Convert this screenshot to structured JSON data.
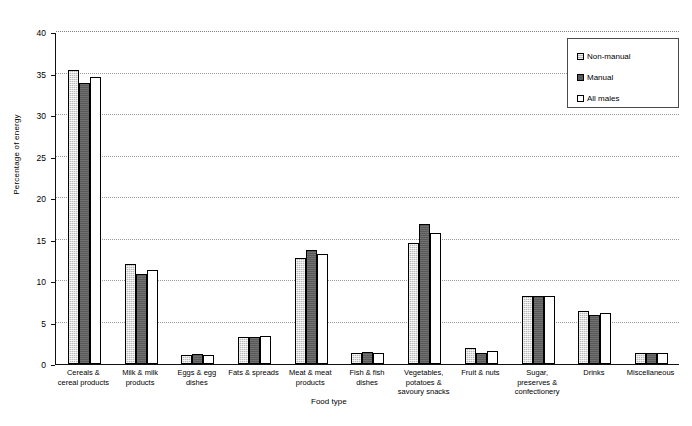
{
  "chart_data": {
    "type": "bar",
    "title": "",
    "subtitle": "",
    "xlabel": "Food type",
    "ylabel": "Percentage of energy",
    "ylim": [
      0,
      40
    ],
    "ytick_step": 5,
    "yticks": [
      "0",
      "5",
      "10",
      "15",
      "20",
      "25",
      "30",
      "35",
      "40"
    ],
    "grid": true,
    "grid_axis": "y",
    "legend_position": "top-right",
    "categories": [
      "Cereals &\ncereal products",
      "Milk & milk\nproducts",
      "Eggs & egg\ndishes",
      "Fats & spreads",
      "Meat & meat\nproducts",
      "Fish & fish\ndishes",
      "Vegetables,\npotatoes &\nsavoury snacks",
      "Fruit & nuts",
      "Sugar,\npreserves &\nconfectionery",
      "Drinks",
      "Miscellaneous"
    ],
    "series": [
      {
        "name": "Non-manual",
        "fill": "light-grey-stipple",
        "color": "#b9b9b9",
        "values": [
          35.4,
          12.0,
          1.1,
          3.2,
          12.8,
          1.3,
          14.6,
          1.9,
          8.2,
          6.4,
          1.3
        ]
      },
      {
        "name": "Manual",
        "fill": "dark-grey",
        "color": "#595959",
        "values": [
          33.9,
          10.8,
          1.2,
          3.3,
          13.7,
          1.4,
          16.9,
          1.3,
          8.2,
          5.9,
          1.3
        ]
      },
      {
        "name": "All males",
        "fill": "white",
        "color": "#ffffff",
        "values": [
          34.6,
          11.3,
          1.1,
          3.4,
          13.3,
          1.3,
          15.8,
          1.6,
          8.2,
          6.2,
          1.3
        ]
      }
    ]
  },
  "legend": {
    "items": [
      {
        "label": "Non-manual"
      },
      {
        "label": "Manual"
      },
      {
        "label": "All males"
      }
    ]
  },
  "axes": {
    "y_title": "Percentage of energy",
    "x_title": "Food type"
  }
}
